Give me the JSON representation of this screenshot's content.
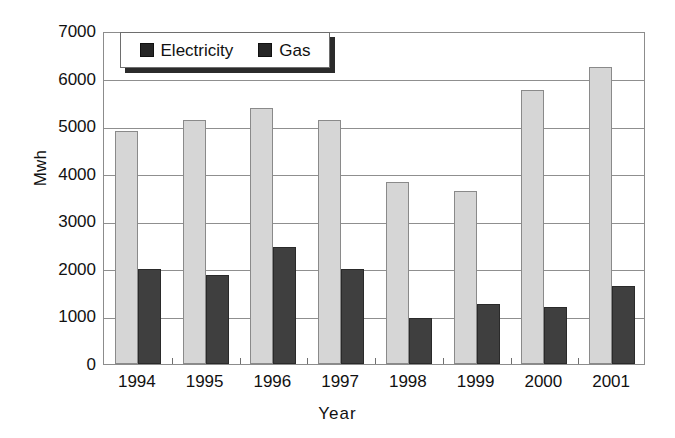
{
  "chart_data": {
    "type": "bar",
    "title": "",
    "xlabel": "Year",
    "ylabel": "Mwh",
    "categories": [
      "1994",
      "1995",
      "1996",
      "1997",
      "1998",
      "1999",
      "2000",
      "2001"
    ],
    "series": [
      {
        "name": "Electricity",
        "color": "#d6d6d6",
        "values": [
          4900,
          5120,
          5380,
          5120,
          3820,
          3640,
          5760,
          6250
        ]
      },
      {
        "name": "Gas",
        "color": "#3f3f3f",
        "values": [
          2000,
          1880,
          2450,
          2000,
          960,
          1270,
          1200,
          1650
        ]
      }
    ],
    "ylim": [
      0,
      7000
    ],
    "yticks": [
      "0",
      "1000",
      "2000",
      "3000",
      "4000",
      "5000",
      "6000",
      "7000"
    ],
    "ytick_values": [
      0,
      1000,
      2000,
      3000,
      4000,
      5000,
      6000,
      7000
    ],
    "grid": true,
    "legend_position": "top-left-inside"
  },
  "legend": {
    "entries": [
      {
        "label": "Electricity",
        "swatch": "legend-swatch-electricity"
      },
      {
        "label": "Gas",
        "swatch": "legend-swatch-gas"
      }
    ]
  }
}
